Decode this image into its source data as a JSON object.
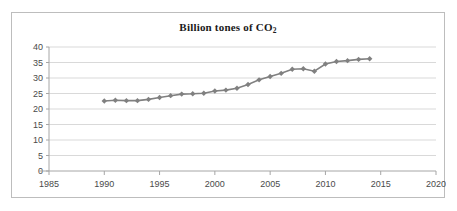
{
  "figure": {
    "border_color": "#bdbdbd",
    "background": "#ffffff"
  },
  "title": {
    "main": "Billion tones of CO",
    "subscript": "2"
  },
  "chart_data": {
    "type": "line",
    "title": "Billion tones of CO2",
    "xlabel": "",
    "ylabel": "",
    "xlim": [
      1985,
      2020
    ],
    "ylim": [
      0,
      40
    ],
    "xticks": [
      1985,
      1990,
      1995,
      2000,
      2005,
      2010,
      2015,
      2020
    ],
    "yticks": [
      0,
      5,
      10,
      15,
      20,
      25,
      30,
      35,
      40
    ],
    "grid": "horizontal",
    "legend": "none",
    "series": [
      {
        "name": "Billion tones of CO2",
        "color": "#808080",
        "marker": "diamond",
        "x": [
          1990,
          1991,
          1992,
          1993,
          1994,
          1995,
          1996,
          1997,
          1998,
          1999,
          2000,
          2001,
          2002,
          2003,
          2004,
          2005,
          2006,
          2007,
          2008,
          2009,
          2010,
          2011,
          2012,
          2013,
          2014
        ],
        "values": [
          22.6,
          22.8,
          22.7,
          22.7,
          23.1,
          23.7,
          24.3,
          24.8,
          24.9,
          25.1,
          25.8,
          26.1,
          26.7,
          27.9,
          29.4,
          30.5,
          31.5,
          32.8,
          33.0,
          32.2,
          34.5,
          35.3,
          35.6,
          36.0,
          36.2
        ]
      }
    ]
  }
}
